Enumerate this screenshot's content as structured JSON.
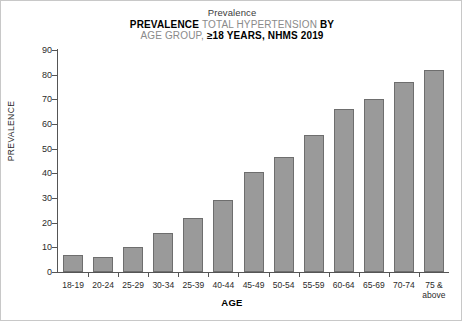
{
  "chart_data": {
    "type": "bar",
    "title": "PREVALENCE TOTAL HYPERTENSION BY AGE GROUP, ≥18 YEARS, NHMS 2019",
    "title_lines": [
      {
        "text": "Prevalence",
        "style": "plain"
      },
      {
        "segments": [
          {
            "text": "PREVALENCE ",
            "style": "bold"
          },
          {
            "text": "TOTAL HYPERTENSION ",
            "style": "gray"
          },
          {
            "text": "BY",
            "style": "bold"
          }
        ]
      },
      {
        "segments": [
          {
            "text": "AGE GROUP, ",
            "style": "gray"
          },
          {
            "text": "≥18 YEARS, NHMS 2019",
            "style": "bold"
          }
        ]
      }
    ],
    "subtitle": "Prevalence",
    "xlabel": "AGE",
    "ylabel": "PREVALENCE",
    "categories": [
      "18-19",
      "20-24",
      "25-29",
      "30-34",
      "25-39",
      "40-44",
      "45-49",
      "50-54",
      "55-59",
      "60-64",
      "65-69",
      "70-74",
      "75 &\nabove"
    ],
    "values": [
      7,
      6,
      10,
      16,
      22,
      29,
      40.5,
      46.5,
      55.5,
      66,
      70,
      77,
      82
    ],
    "ylim": [
      0,
      90
    ],
    "yticks": [
      0,
      10,
      20,
      30,
      40,
      50,
      60,
      70,
      80,
      90
    ],
    "grid": false,
    "legend": null,
    "bar_color": "#9a9a9a",
    "bar_edge_color": "#6e6e6e",
    "axis_color": "#555555",
    "background": "#ffffff"
  }
}
